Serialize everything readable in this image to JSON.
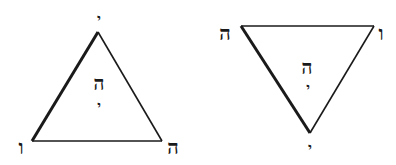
{
  "diagram": {
    "colors": {
      "stroke": "#1a1a1a",
      "background": "#ffffff"
    },
    "triangles": [
      {
        "orientation": "upward",
        "vertices": {
          "apex": {
            "label": "י",
            "name": "yod"
          },
          "bottom_left": {
            "label": "ו",
            "name": "vav"
          },
          "bottom_right": {
            "label": "ה",
            "name": "he"
          }
        },
        "center": {
          "upper": "ה",
          "lower": "י"
        }
      },
      {
        "orientation": "downward",
        "vertices": {
          "top_left": {
            "label": "ה",
            "name": "he"
          },
          "top_right": {
            "label": "ו",
            "name": "vav"
          },
          "bottom": {
            "label": "י",
            "name": "yod"
          }
        },
        "center": {
          "upper": "ה",
          "lower": "י"
        }
      }
    ]
  }
}
